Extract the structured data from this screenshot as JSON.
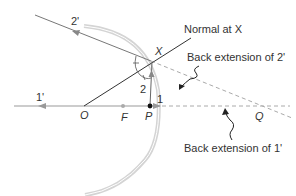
{
  "diagram": {
    "colors": {
      "mirror": "#c8c8c8",
      "ray": "#555555",
      "axis": "#999999",
      "dashed": "#aaaaaa",
      "point": "#111111",
      "text": "#333333"
    },
    "labels": {
      "ray_in_2": "2",
      "ray_out_2": "2'",
      "ray_in_1": "1",
      "ray_out_1": "1'",
      "point_x": "X",
      "point_o": "O",
      "point_f": "F",
      "point_p": "P",
      "point_q": "Q",
      "normal": "Normal at X",
      "back_ext_2": "Back extension of 2'",
      "back_ext_1": "Back extension of 1'"
    }
  }
}
